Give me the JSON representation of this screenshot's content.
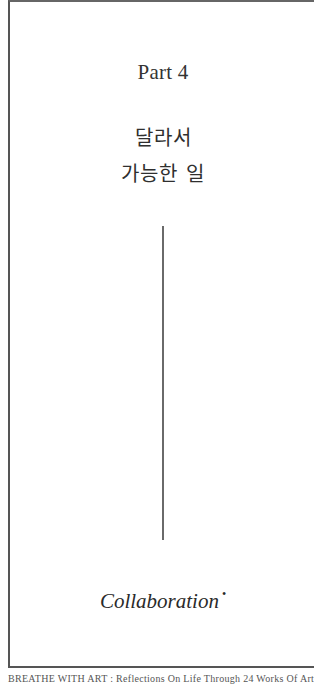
{
  "page": {
    "part_label": "Part 4",
    "title_lines": [
      "달라서",
      "가능한 일"
    ],
    "subtitle": "Collaboration",
    "subtitle_mark": "•",
    "footer": "BREATHE WITH ART : Reflections On Life Through 24 Works Of Art"
  },
  "colors": {
    "frame": "#555555",
    "text": "#2b2b2b",
    "divider": "#6a6a6a",
    "background": "#ffffff"
  }
}
